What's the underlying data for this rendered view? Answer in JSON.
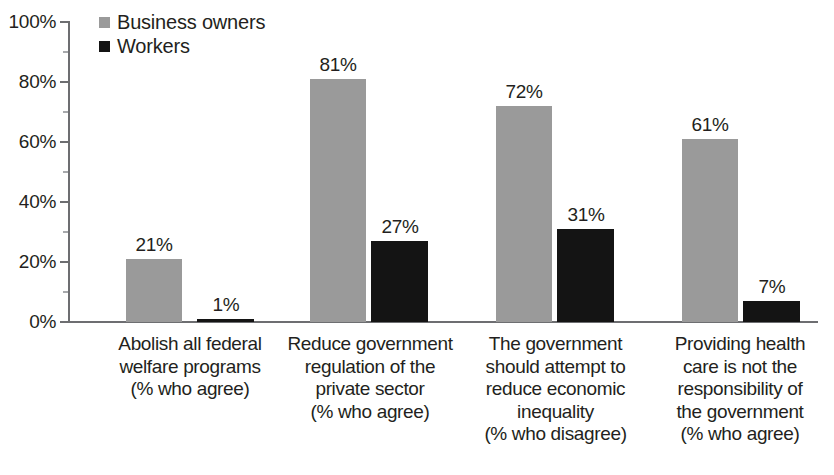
{
  "chart_data": {
    "type": "bar",
    "title": "",
    "subtitle": "",
    "xlabel": "",
    "ylabel": "",
    "ylim": [
      0,
      100
    ],
    "y_ticks": [
      "0%",
      "20%",
      "40%",
      "60%",
      "80%",
      "100%"
    ],
    "y_tick_values": [
      0,
      20,
      40,
      60,
      80,
      100
    ],
    "grid": false,
    "legend_position": "top-left",
    "value_suffix": "%",
    "categories": [
      "Abolish all federal welfare programs (% who agree)",
      "Reduce government regulation of the private sector (% who agree)",
      "The government should attempt to reduce economic inequality (% who disagree)",
      "Providing health care is not the responsibility of the government (% who agree)"
    ],
    "category_lines": [
      [
        "Abolish all federal",
        "welfare programs",
        "(% who agree)"
      ],
      [
        "Reduce government",
        "regulation of the",
        "private sector",
        "(% who agree)"
      ],
      [
        "The government",
        "should attempt to",
        "reduce economic",
        "inequality",
        "(% who disagree)"
      ],
      [
        "Providing health",
        "care is not the",
        "responsibility of",
        "the government",
        "(% who agree)"
      ]
    ],
    "series": [
      {
        "name": "Business owners",
        "color": "#9a9a9a",
        "values": [
          21,
          81,
          72,
          61
        ],
        "labels": [
          "21%",
          "81%",
          "72%",
          "61%"
        ]
      },
      {
        "name": "Workers",
        "color": "#141414",
        "values": [
          1,
          27,
          31,
          7
        ],
        "labels": [
          "1%",
          "27%",
          "31%",
          "7%"
        ]
      }
    ]
  },
  "legend": {
    "items": [
      {
        "label": "Business owners",
        "swatch": "owners-swatch-icon"
      },
      {
        "label": "Workers",
        "swatch": "workers-swatch-icon"
      }
    ]
  },
  "axis": {
    "y_labels": [
      "100%",
      "80%",
      "60%",
      "40%",
      "20%",
      "0%"
    ]
  }
}
